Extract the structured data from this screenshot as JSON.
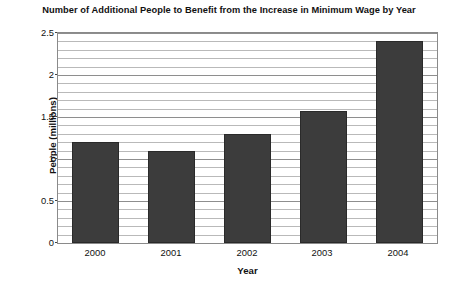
{
  "chart_data": {
    "type": "bar",
    "title": "Number of Additional People to Benefit from the Increase in Minimum Wage by Year",
    "xlabel": "Year",
    "ylabel": "People (millions)",
    "categories": [
      "2000",
      "2001",
      "2002",
      "2003",
      "2004"
    ],
    "values": [
      1.2,
      1.1,
      1.3,
      1.57,
      2.4
    ],
    "series": [
      {
        "name": "Additional people to benefit",
        "values": [
          1.2,
          1.1,
          1.3,
          1.57,
          2.4
        ]
      }
    ],
    "ylim": [
      0,
      2.5
    ],
    "ytick_values": [
      0,
      0.5,
      1,
      1.5,
      2,
      2.5
    ],
    "ytick_labels": [
      "0",
      "0.5",
      "1",
      "1.5",
      "2",
      "2.5"
    ],
    "minor_tick_step": 0.1,
    "grid": true,
    "grid_axis": "y",
    "legend": false,
    "legend_position": "none",
    "bar_color": "#3c3c3c",
    "plot_background": "#ffffff",
    "gridline_color": "#b9b9b9"
  }
}
